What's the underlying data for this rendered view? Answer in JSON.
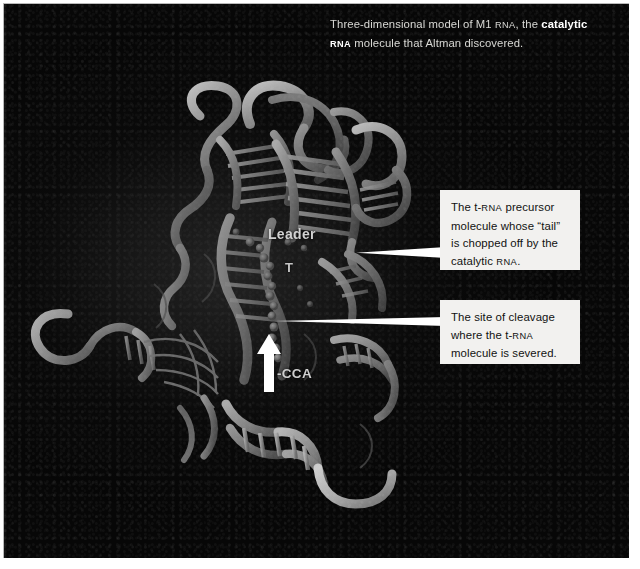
{
  "figure": {
    "caption": {
      "line1_a": "Three-dimensional model of M1 ",
      "line1_sc": "RNA",
      "line1_b": ", the ",
      "line1_bold": "catalytic",
      "line2_sc": "RNA",
      "line2_b": " molecule that Altman discovered."
    },
    "callouts": [
      {
        "id": "trna-precursor",
        "line1_a": "The t-",
        "line1_sc": "RNA",
        "line1_b": " precursor",
        "line2": "molecule whose “tail”",
        "line3": "is chopped off by the",
        "line4_a": "catalytic ",
        "line4_sc": "RNA",
        "line4_b": "."
      },
      {
        "id": "cleavage-site",
        "line1": "The site of cleavage",
        "line2_a": "where the t-",
        "line2_sc": "RNA",
        "line3": "molecule is severed."
      }
    ],
    "molecule_labels": [
      {
        "id": "leader",
        "text": "Leader"
      },
      {
        "id": "t-loop",
        "text": "T"
      },
      {
        "id": "cca-end",
        "text": "-CCA"
      }
    ],
    "arrow": {
      "id": "cleavage-arrow",
      "direction": "up"
    },
    "colors": {
      "plate_background": "#070707",
      "callout_background": "#f2f1ef",
      "callout_text": "#111111",
      "caption_text": "#d8d8d4",
      "caption_emphasis": "#ffffff",
      "leader_line": "#ffffff",
      "label_text": "#d2d2d2",
      "frame_rule": "#b9b9b9",
      "ribbon_light": "#cfcfcf",
      "ribbon_mid": "#8a8a8a",
      "ribbon_dark": "#4a4a4a"
    }
  }
}
